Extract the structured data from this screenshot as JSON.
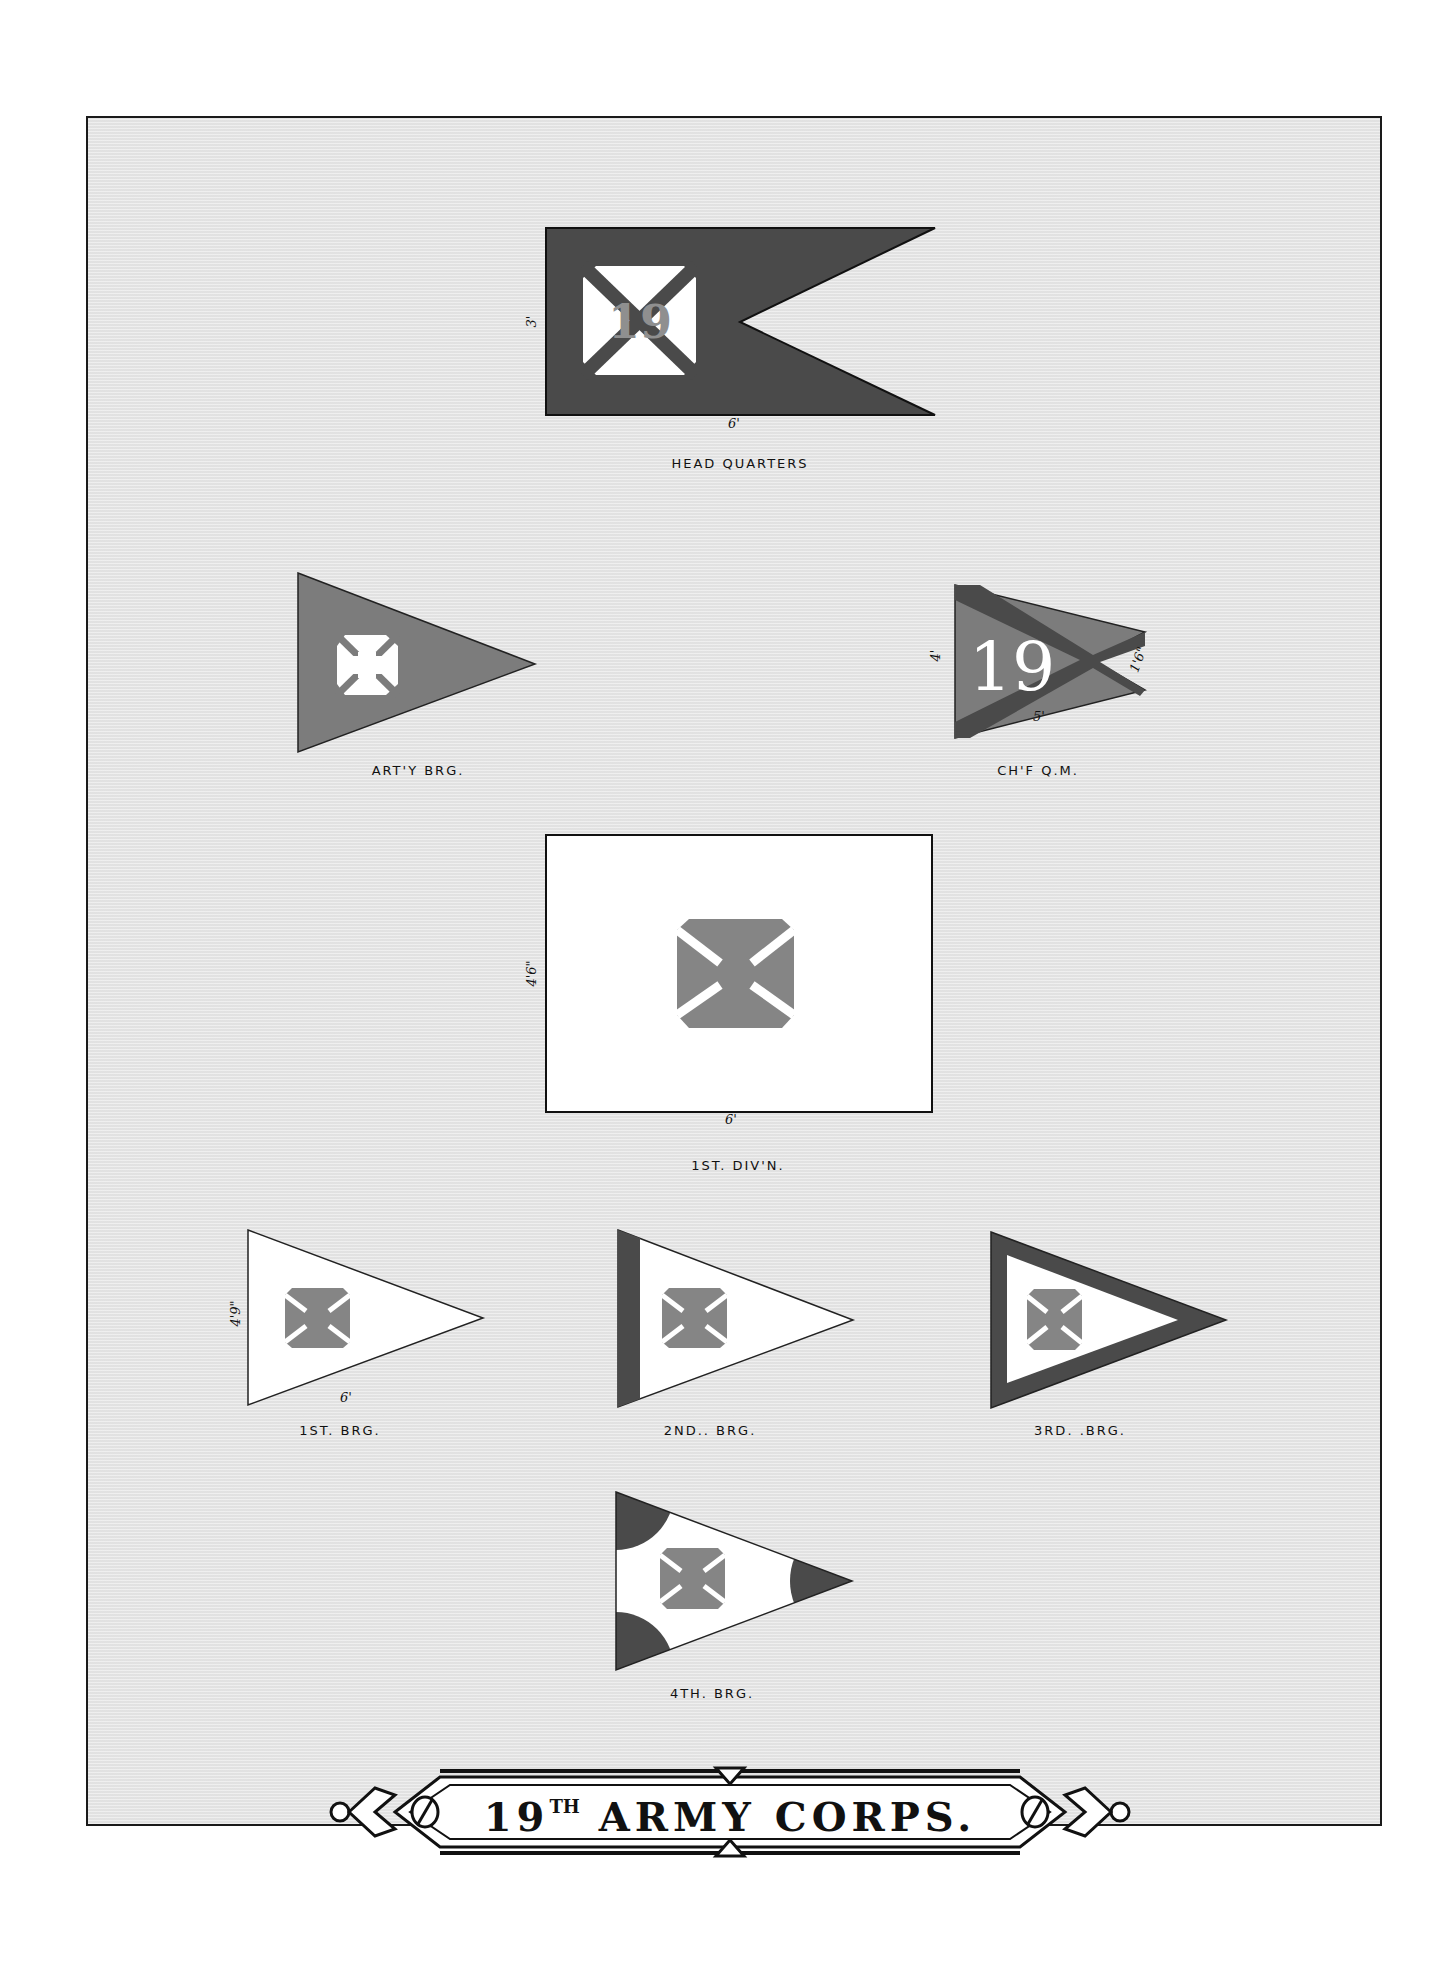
{
  "plate": {
    "title": {
      "number": "19",
      "ordinal": "TH",
      "text": "ARMY CORPS."
    },
    "colors": {
      "background": "#e6e6e6",
      "dark_blue_flag": "#4a4a4a",
      "red_flag": "#7c7c7c",
      "white_flag": "#ffffff",
      "cross_red": "#858585",
      "frame": "#1a1a1a"
    },
    "flags": [
      {
        "id": "hq",
        "label": "HEAD QUARTERS",
        "dimensions": {
          "height": "3'",
          "width": "6'"
        },
        "shape": "swallowtail",
        "emblem": "white cross square with 19"
      },
      {
        "id": "arty",
        "label": "ART'Y BRG.",
        "shape": "triangle",
        "emblem": "white cross"
      },
      {
        "id": "chf_qm",
        "label": "CH'F Q.M.",
        "dimensions": {
          "height": "4'",
          "width": "5'",
          "fly": "1'6\""
        },
        "shape": "swallowtail-triangle",
        "emblem": "19 with saltire"
      },
      {
        "id": "div1",
        "label": "1ST. DIV'N.",
        "dimensions": {
          "height": "4'6\"",
          "width": "6'"
        },
        "shape": "rectangle",
        "emblem": "red cross"
      },
      {
        "id": "brg1",
        "label": "1ST. BRG.",
        "dimensions": {
          "height": "4'9\"",
          "width": "6'"
        },
        "shape": "triangle",
        "emblem": "red cross"
      },
      {
        "id": "brg2",
        "label": "2ND.. BRG.",
        "shape": "triangle with hoist stripe",
        "emblem": "red cross"
      },
      {
        "id": "brg3",
        "label": "3RD. .BRG.",
        "shape": "triangle with border",
        "emblem": "red cross"
      },
      {
        "id": "brg4",
        "label": "4TH. BRG.",
        "shape": "triangle with corner discs",
        "emblem": "red cross"
      }
    ],
    "labels": {
      "hq": "HEAD QUARTERS",
      "arty": "ART'Y BRG.",
      "chf_qm": "CH'F Q.M.",
      "div1": "1ST. DIV'N.",
      "brg1": "1ST. BRG.",
      "brg2": "2ND.. BRG.",
      "brg3": "3RD. .BRG.",
      "brg4": "4TH. BRG."
    },
    "dims": {
      "hq_h": "3'",
      "hq_w": "6'",
      "qm_h": "4'",
      "qm_w": "5'",
      "qm_fly": "1'6\"",
      "div_h": "4'6\"",
      "div_w": "6'",
      "brg1_h": "4'9\"",
      "brg1_w": "6'"
    },
    "numerals": {
      "hq": "19",
      "qm": "19"
    }
  }
}
